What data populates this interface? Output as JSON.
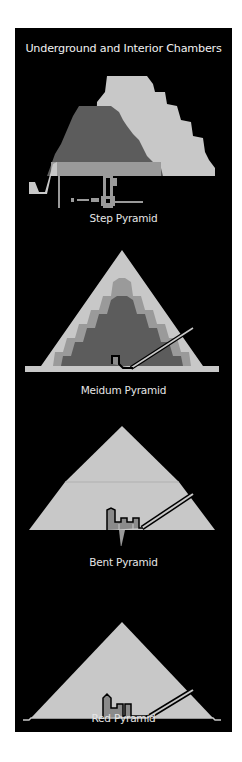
{
  "title": "Underground and Interior Chambers",
  "colors": {
    "background": "#000000",
    "outer_casing": "#c8c8c8",
    "middle_layer": "#9a9a9a",
    "inner_core": "#5c5c5c",
    "chamber_fill": "#8a8a8a",
    "passage_outline": "#000000",
    "text": "#e6e6e6"
  },
  "pyramids": [
    {
      "id": "step",
      "label": "Step Pyramid"
    },
    {
      "id": "meidum",
      "label": "Meidum Pyramid"
    },
    {
      "id": "bent",
      "label": "Bent Pyramid"
    },
    {
      "id": "red",
      "label": "Red Pyramid"
    }
  ]
}
